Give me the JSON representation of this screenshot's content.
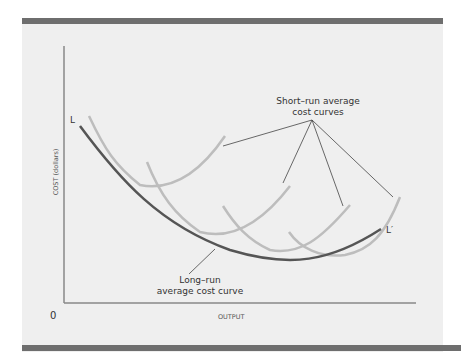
{
  "diagram": {
    "type": "economics-cost-curves",
    "y_axis_label": "COST (dollars)",
    "x_axis_label": "OUTPUT",
    "origin_label": "0",
    "curve_labels": {
      "long_run_start": "L",
      "long_run_end": "L′"
    },
    "annotations": {
      "short_run_line1": "Short–run average",
      "short_run_line2": "cost curves",
      "long_run_line1": "Long–run",
      "long_run_line2": "average cost curve"
    },
    "colors": {
      "panel_bg": "#efefef",
      "rule": "#6e6e6e",
      "axis": "#888888",
      "long_run_curve": "#555555",
      "short_run_curves": "#bdbdbd",
      "leader_lines": "#444444"
    }
  }
}
